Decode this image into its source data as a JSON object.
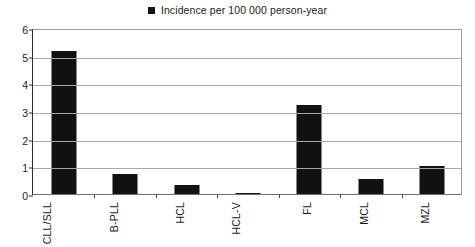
{
  "legend": {
    "marker": "filled-square",
    "label": "Incidence per 100 000 person-year",
    "position": "top-center"
  },
  "colors": {
    "bar": "#111111",
    "gridline": "#a8a8a8",
    "axis": "#2b2b2b",
    "background": "#ffffff",
    "text": "#1a1a1a"
  },
  "chart_data": {
    "type": "bar",
    "title": "",
    "subtitle": "",
    "xlabel": "",
    "ylabel": "",
    "categories": [
      "CLL/SLL",
      "B-PLL",
      "HCL",
      "HCL-V",
      "FL",
      "MCL",
      "MZL"
    ],
    "values": [
      5.17,
      0.72,
      0.33,
      0.05,
      3.21,
      0.55,
      1.03
    ],
    "series": [
      {
        "name": "Incidence per 100 000 person-year",
        "values": [
          5.17,
          0.72,
          0.33,
          0.05,
          3.21,
          0.55,
          1.03
        ]
      }
    ],
    "ylim": [
      0,
      6
    ],
    "yticks": [
      0,
      1,
      2,
      3,
      4,
      5,
      6
    ],
    "ytick_labels": [
      "0",
      "1",
      "2",
      "3",
      "4",
      "5",
      "6"
    ],
    "grid": true,
    "grid_axis": "y",
    "legend_position": "top-center",
    "xtick_label_rotation": -90,
    "annotations": []
  }
}
